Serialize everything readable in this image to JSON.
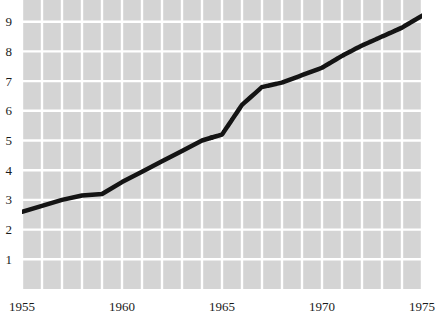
{
  "chart_data": {
    "type": "line",
    "title": "",
    "subtitle": "",
    "xlabel": "",
    "ylabel": "",
    "xlim": [
      1955,
      1975
    ],
    "ylim": [
      0,
      10
    ],
    "grid": true,
    "grid_color": "#ffffff",
    "plot_background": "#d4d4d4",
    "legend": [],
    "legend_position": "none",
    "x_ticks": [
      {
        "value": 1955,
        "label": "1955"
      },
      {
        "value": 1960,
        "label": "1960"
      },
      {
        "value": 1965,
        "label": "1965"
      },
      {
        "value": 1970,
        "label": "1970"
      },
      {
        "value": 1975,
        "label": "1975"
      }
    ],
    "x_minor_gridlines_step": 1,
    "y_ticks": [
      {
        "value": 10,
        "label": "10"
      },
      {
        "value": 9,
        "label": "9"
      },
      {
        "value": 8,
        "label": "8"
      },
      {
        "value": 7,
        "label": "7"
      },
      {
        "value": 6,
        "label": "6"
      },
      {
        "value": 5,
        "label": "5"
      },
      {
        "value": 4,
        "label": "4"
      },
      {
        "value": 3,
        "label": "3"
      },
      {
        "value": 2,
        "label": "2"
      },
      {
        "value": 1,
        "label": "1"
      }
    ],
    "series": [
      {
        "name": "observed",
        "style": "solid",
        "color": "#141414",
        "linewidth": 4.5,
        "x": [
          1955,
          1956,
          1957,
          1958,
          1959,
          1960,
          1961,
          1962,
          1963,
          1964,
          1964.5
        ],
        "values": [
          2.6,
          2.8,
          3.0,
          3.15,
          3.2,
          3.6,
          3.95,
          4.3,
          4.65,
          5.0,
          5.1
        ]
      },
      {
        "name": "projected",
        "style": "dotted",
        "color": "#141414",
        "linewidth": 4.5,
        "x": [
          1964.5,
          1965,
          1966,
          1967,
          1968,
          1969,
          1970,
          1971,
          1972,
          1973,
          1974,
          1975
        ],
        "values": [
          5.1,
          5.2,
          6.2,
          6.8,
          6.95,
          7.2,
          7.45,
          7.85,
          8.2,
          8.5,
          8.8,
          9.2
        ]
      }
    ]
  }
}
